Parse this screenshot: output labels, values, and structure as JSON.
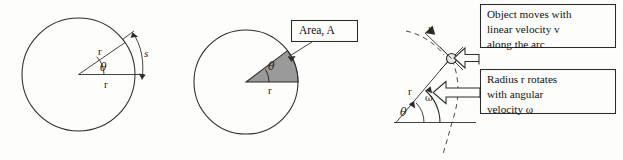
{
  "figure": {
    "background_color": "#fdfdfc",
    "ink_color": "#2b2b2b",
    "sector_fill_color": "#9a9a9a"
  },
  "panel_arc": {
    "name": "arc-length-diagram",
    "radius_label_1": "r",
    "radius_label_2": "r",
    "angle_label": "θ",
    "arc_label": "s"
  },
  "panel_area": {
    "name": "sector-area-diagram",
    "radius_label": "r",
    "angle_label": "θ",
    "callout_label": "Area, A"
  },
  "panel_velocity": {
    "name": "angular-velocity-diagram",
    "velocity_label": "v",
    "radius_label": "r",
    "angular_velocity_label": "ω",
    "angle_label": "θ",
    "callout_linear": "Object moves with\nlinear velocity v\nalong the arc",
    "callout_angular": "Radius r rotates\nwith angular\nvelocity ω"
  }
}
